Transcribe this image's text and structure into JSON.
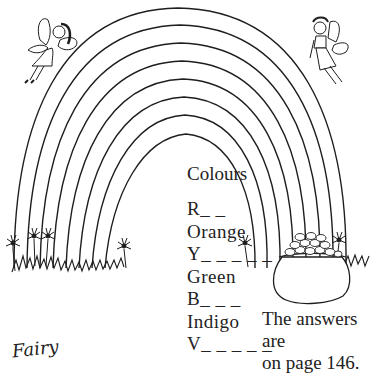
{
  "page": {
    "type": "activity-page",
    "illustration": {
      "rainbow_arcs": 8,
      "elements": [
        "fairy-left",
        "fairy-right",
        "rainbow",
        "pot-of-gold",
        "grass",
        "flowers"
      ],
      "line_color": "#1e1e1e",
      "background": "#ffffff"
    },
    "puzzle": {
      "title": "Colours",
      "items": [
        {
          "text": "R_ _",
          "answer_hidden": true
        },
        {
          "text": "Orange",
          "answer_hidden": false
        },
        {
          "text": "Y_ _ _ _ _",
          "answer_hidden": true
        },
        {
          "text": "Green",
          "answer_hidden": false
        },
        {
          "text": "B_ _ _",
          "answer_hidden": true
        },
        {
          "text": "Indigo",
          "answer_hidden": false
        },
        {
          "text": "V_ _ _ _ _",
          "answer_hidden": true
        }
      ]
    },
    "answers_note": {
      "line1": "The answers are",
      "line2": "on page 146."
    },
    "footer_label": "Fairy"
  }
}
